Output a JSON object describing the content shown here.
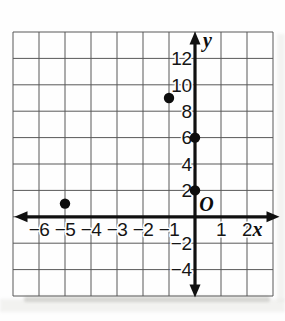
{
  "chart_data": {
    "type": "scatter",
    "title": "",
    "points": [
      [
        -5,
        1
      ],
      [
        -1,
        9
      ],
      [
        0,
        6
      ],
      [
        0,
        2
      ]
    ],
    "x_axis": {
      "label": "x",
      "range": [
        -7,
        3
      ],
      "grid_step": 1,
      "tick_labels": [
        -6,
        -5,
        -4,
        -3,
        -2,
        -1,
        1,
        2
      ]
    },
    "y_axis": {
      "label": "y",
      "range": [
        -6,
        14
      ],
      "grid_step": 2,
      "tick_labels": [
        12,
        10,
        8,
        6,
        4,
        2,
        -2,
        -4
      ]
    },
    "origin_label": "O",
    "grid": true,
    "legend": "none",
    "point_style": "filled-black-dot",
    "colors": {
      "axis": "#111111",
      "grid": "#5a5a5a",
      "points": "#111111",
      "text": "#151515",
      "background": "#ffffff"
    }
  }
}
